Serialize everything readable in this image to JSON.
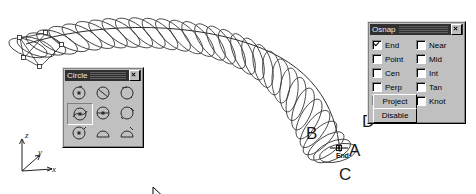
{
  "app": {
    "context": "3d-cad-viewport",
    "background_color": "#ffffff",
    "curve_color": "#333333"
  },
  "viewport": {
    "axis_gizmo": {
      "x_label": "x",
      "y_label": "y",
      "z_label": "z"
    },
    "annotations": [
      {
        "id": "B",
        "label": "B"
      },
      {
        "id": "C",
        "label": "C"
      },
      {
        "id": "D",
        "label": "D"
      },
      {
        "id": "A",
        "label": "A"
      }
    ],
    "osnap_marker": {
      "label": "End"
    }
  },
  "circle_toolbar": {
    "title": "Circle",
    "close_label": "x",
    "tooltip": "Circle: Around Curve",
    "selected_index": 3,
    "tools": [
      {
        "name": "circle-center-radius",
        "label": "Circle: Center, Radius"
      },
      {
        "name": "circle-diameter",
        "label": "Circle: Diameter"
      },
      {
        "name": "circle-2-point",
        "label": "Circle: 2 Point"
      },
      {
        "name": "circle-around-curve",
        "label": "Circle: Around Curve"
      },
      {
        "name": "circle-3-point",
        "label": "Circle: 3 Point"
      },
      {
        "name": "circle-tangent-tangent",
        "label": "Circle: Tangent, Tangent"
      },
      {
        "name": "circle-tangent-radius",
        "label": "Circle: Tangent, Radius"
      },
      {
        "name": "circle-fit-points",
        "label": "Circle: Fit Points"
      },
      {
        "name": "circle-deformable",
        "label": "Circle: Deformable"
      }
    ]
  },
  "osnap_panel": {
    "title": "Osnap",
    "close_label": "x",
    "options": [
      {
        "label": "End",
        "checked": true
      },
      {
        "label": "Near",
        "checked": false
      },
      {
        "label": "Point",
        "checked": false
      },
      {
        "label": "Mid",
        "checked": false
      },
      {
        "label": "Cen",
        "checked": false
      },
      {
        "label": "Int",
        "checked": false
      },
      {
        "label": "Perp",
        "checked": false
      },
      {
        "label": "Tan",
        "checked": false
      },
      {
        "label": "Quad",
        "checked": false
      },
      {
        "label": "Knot",
        "checked": false
      }
    ],
    "buttons": {
      "project": "Project",
      "disable": "Disable"
    }
  }
}
